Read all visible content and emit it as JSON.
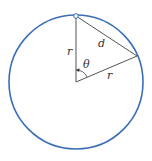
{
  "diagram": {
    "colors": {
      "circle": "#3a6fb7",
      "lines": "#555555",
      "point_fill": "#ffffff"
    },
    "labels": {
      "radius_vertical": "r",
      "chord": "d",
      "angle": "θ",
      "radius_slanted": "r"
    }
  }
}
